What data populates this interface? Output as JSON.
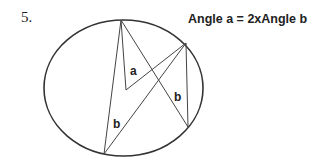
{
  "question": {
    "number": "5.",
    "caption": "Angle a = 2xAngle b"
  },
  "diagram": {
    "shape": "circle",
    "points": {
      "top": [
        121,
        20
      ],
      "right": [
        186,
        43
      ],
      "center": [
        126,
        90
      ],
      "bottom_left": [
        104,
        154
      ],
      "bottom_right": [
        188,
        127
      ]
    },
    "labels": {
      "center_angle": "a",
      "inscribed_angle_right": "b",
      "inscribed_angle_left": "b"
    },
    "stroke_color": "#333333"
  }
}
